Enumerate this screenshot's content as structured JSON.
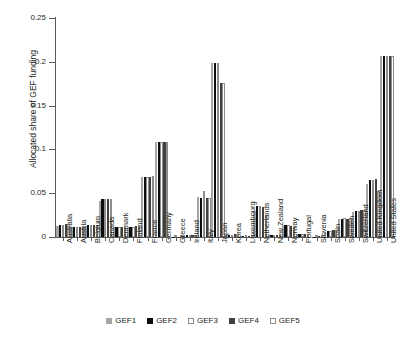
{
  "chart_data": {
    "type": "bar",
    "title": "",
    "xlabel": "",
    "ylabel": "Allocated share of GEF funding",
    "ylim": [
      0,
      0.25
    ],
    "yticks": [
      0,
      0.05,
      0.1,
      0.15,
      0.2,
      0.25
    ],
    "ytick_labels": [
      "0",
      "0.05",
      "0.1",
      "0.15",
      "0.2",
      "0.25"
    ],
    "grid": false,
    "legend_position": "bottom",
    "categories": [
      "Australia",
      "Austria",
      "Belgium",
      "Canada",
      "Denmark",
      "Finland",
      "France",
      "Germany",
      "Greece",
      "Ireland",
      "Italy",
      "Japan",
      "Korea",
      "Luxembourg",
      "Netherlands",
      "New Zealand",
      "Norway",
      "Portugal",
      "Slovenia",
      "Spain",
      "Sweden",
      "Switzerland",
      "United Kingdom",
      "United States"
    ],
    "series": [
      {
        "name": "GEF1",
        "color": "#a6a6a6",
        "values": [
          0.013,
          0.011,
          0.013,
          0.041,
          0.011,
          0.011,
          0.069,
          0.108,
          0.0,
          0.002,
          0.046,
          0.199,
          0.002,
          0.001,
          0.03,
          0.002,
          0.013,
          0.003,
          0.0,
          0.006,
          0.02,
          0.029,
          0.06,
          0.207
        ]
      },
      {
        "name": "GEF2",
        "color": "#0d0d0d",
        "values": [
          0.014,
          0.012,
          0.014,
          0.043,
          0.012,
          0.012,
          0.069,
          0.109,
          0.0,
          0.002,
          0.045,
          0.199,
          0.002,
          0.001,
          0.035,
          0.002,
          0.014,
          0.003,
          0.0,
          0.007,
          0.02,
          0.03,
          0.065,
          0.207
        ]
      },
      {
        "name": "GEF3",
        "color": "#ffffff",
        "values": [
          0.014,
          0.012,
          0.014,
          0.043,
          0.012,
          0.012,
          0.069,
          0.109,
          0.0,
          0.002,
          0.052,
          0.199,
          0.002,
          0.001,
          0.035,
          0.002,
          0.014,
          0.003,
          0.0,
          0.007,
          0.022,
          0.03,
          0.065,
          0.207
        ]
      },
      {
        "name": "GEF4",
        "color": "#404040",
        "values": [
          0.015,
          0.012,
          0.014,
          0.043,
          0.012,
          0.013,
          0.069,
          0.109,
          0.0,
          0.002,
          0.045,
          0.176,
          0.003,
          0.001,
          0.034,
          0.002,
          0.013,
          0.003,
          0.001,
          0.008,
          0.021,
          0.031,
          0.066,
          0.207
        ]
      },
      {
        "name": "GEF5",
        "color": "#ffffff",
        "values": [
          0.015,
          0.012,
          0.014,
          0.043,
          0.012,
          0.013,
          0.07,
          0.109,
          0.001,
          0.002,
          0.045,
          0.176,
          0.003,
          0.001,
          0.025,
          0.002,
          0.012,
          0.003,
          0.001,
          0.008,
          0.022,
          0.031,
          0.052,
          0.207
        ]
      }
    ]
  },
  "legend": {
    "items": [
      {
        "label": "GEF1",
        "color": "#a6a6a6",
        "outlined": false
      },
      {
        "label": "GEF2",
        "color": "#0d0d0d",
        "outlined": false
      },
      {
        "label": "GEF3",
        "color": "#ffffff",
        "outlined": true
      },
      {
        "label": "GEF4",
        "color": "#404040",
        "outlined": false
      },
      {
        "label": "GEF5",
        "color": "#ffffff",
        "outlined": true
      }
    ]
  },
  "colors": {
    "axis": "#58595b",
    "text": "#231f20",
    "background": "#ffffff"
  }
}
